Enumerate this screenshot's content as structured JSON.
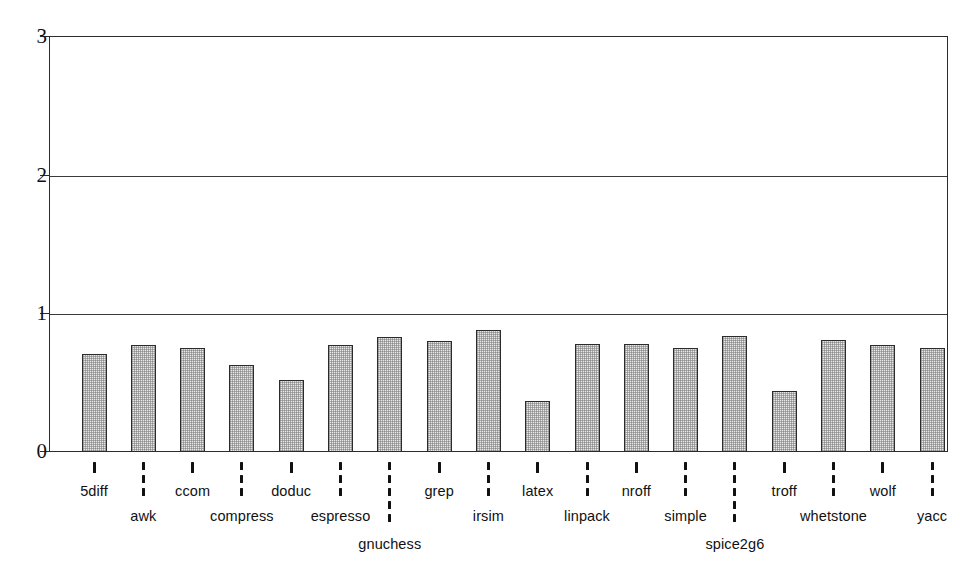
{
  "chart_data": {
    "type": "bar",
    "title": "",
    "subtitle": "",
    "xlabel": "",
    "ylabel": "",
    "ylim": [
      0,
      3
    ],
    "yticks": [
      0,
      1,
      2,
      3
    ],
    "ytick_labels": [
      "0",
      "1",
      "2",
      "3"
    ],
    "grid": "horizontal",
    "legend": "none",
    "bar_fill": "#e8e8e8",
    "bar_edge": "#2b2b2b",
    "categories": [
      "5diff",
      "awk",
      "ccom",
      "compress",
      "doduc",
      "espresso",
      "gnuchess",
      "grep",
      "irsim",
      "latex",
      "linpack",
      "nroff",
      "simple",
      "spice2g6",
      "troff",
      "whetstone",
      "wolf",
      "yacc"
    ],
    "values": [
      0.71,
      0.77,
      0.75,
      0.63,
      0.52,
      0.77,
      0.83,
      0.8,
      0.88,
      0.37,
      0.78,
      0.78,
      0.75,
      0.84,
      0.44,
      0.81,
      0.77,
      0.75
    ],
    "label_rows": [
      0,
      1,
      0,
      1,
      0,
      1,
      2,
      0,
      1,
      0,
      1,
      0,
      1,
      2,
      0,
      1,
      0,
      1
    ]
  }
}
